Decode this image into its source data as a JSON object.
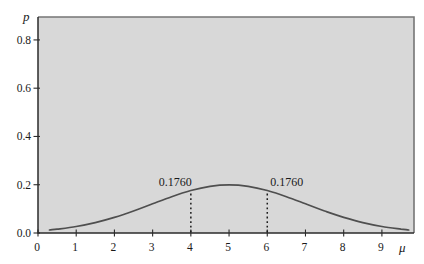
{
  "chart_data": {
    "type": "line",
    "title": "",
    "xlabel": "μ",
    "ylabel": "p",
    "xlim": [
      0,
      9.84
    ],
    "ylim": [
      0,
      0.895
    ],
    "x_ticks": [
      0,
      1,
      2,
      3,
      4,
      5,
      6,
      7,
      8,
      9
    ],
    "y_ticks": [
      0.0,
      0.2,
      0.4,
      0.6,
      0.8
    ],
    "y_tick_labels": [
      "0.0",
      "0.2",
      "0.4",
      "0.6",
      "0.8"
    ],
    "grid": false,
    "legend": "none",
    "colors": {
      "plot_background": "#d8d8d8",
      "frame": "#757575",
      "axis": "#2b2b2b",
      "curve": "#4f4f4f",
      "dashed_line": "#1c1c1c",
      "text": "#1a1a1a"
    },
    "series": [
      {
        "name": "posterior-density-curve",
        "x": [
          0.3,
          0.5,
          1.0,
          1.5,
          2.0,
          2.5,
          3.0,
          3.5,
          4.0,
          4.5,
          5.0,
          5.5,
          6.0,
          6.5,
          7.0,
          7.5,
          8.0,
          8.5,
          9.0,
          9.5,
          9.7
        ],
        "y": [
          0.0126,
          0.0159,
          0.027,
          0.0431,
          0.0648,
          0.0913,
          0.121,
          0.1506,
          0.176,
          0.1933,
          0.1995,
          0.1933,
          0.176,
          0.1506,
          0.121,
          0.0913,
          0.0648,
          0.0431,
          0.027,
          0.0159,
          0.0126
        ]
      }
    ],
    "peak": {
      "x": 5,
      "y": 0.1995
    },
    "annotations": [
      {
        "x": 4,
        "y": 0.176,
        "label": "0.1760",
        "align": "end"
      },
      {
        "x": 6,
        "y": 0.176,
        "label": "0.1760",
        "align": "start"
      }
    ]
  }
}
